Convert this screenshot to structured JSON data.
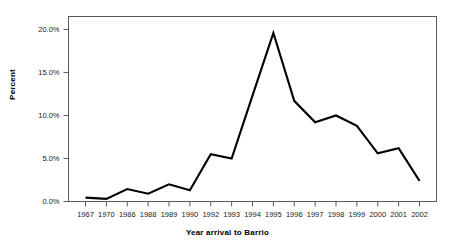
{
  "chart_data": {
    "type": "line",
    "title": "",
    "xlabel": "Year arrival to Barrio",
    "ylabel": "Percent",
    "categories": [
      "1967",
      "1970",
      "1986",
      "1988",
      "1989",
      "1990",
      "1992",
      "1993",
      "1994",
      "1995",
      "1996",
      "1997",
      "1998",
      "1999",
      "2000",
      "2001",
      "2002"
    ],
    "values": [
      0.45,
      0.3,
      1.45,
      0.9,
      2.0,
      1.3,
      5.5,
      5.0,
      12.3,
      19.6,
      11.7,
      9.2,
      10.0,
      8.8,
      5.6,
      6.2,
      2.4
    ],
    "series": [
      {
        "name": "Percent",
        "values": [
          0.45,
          0.3,
          1.45,
          0.9,
          2.0,
          1.3,
          5.5,
          5.0,
          12.3,
          19.6,
          11.7,
          9.2,
          10.0,
          8.8,
          5.6,
          6.2,
          2.4
        ]
      }
    ],
    "ylim": [
      0,
      21.5
    ],
    "yticks": [
      0,
      5,
      10,
      15,
      20
    ],
    "ytick_labels": [
      "0.0%",
      "5.0%",
      "10.0%",
      "15.0%",
      "20.0%"
    ],
    "grid": false,
    "legend": "none",
    "line_color": "#000000",
    "frame_color": "#5a5a5a",
    "background_color": "#ffffff"
  },
  "axes": {
    "y_title": "Percent",
    "x_title": "Year arrival to Barrio"
  }
}
